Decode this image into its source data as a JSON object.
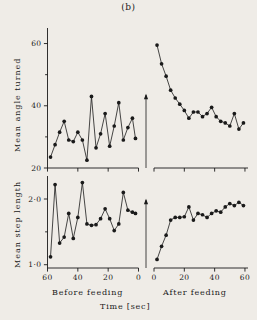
{
  "figure": {
    "title": "(b)",
    "xlabel": "Time [sec]",
    "left_section_label": "Before feeding",
    "right_section_label": "After feeding",
    "event_marker": "feeding-arrow",
    "background_color": "#efece7",
    "ink_color": "#1a1a1a"
  },
  "axes": {
    "angle_ylabel": "Mean angle turned",
    "step_ylabel": "Mean step length",
    "angle_yticks": [
      "60",
      "40",
      "20"
    ],
    "step_yticks": [
      "2·0",
      "1·0"
    ],
    "before_xticks": [
      "60",
      "40",
      "20",
      "0"
    ],
    "after_xticks": [
      "0",
      "20",
      "40",
      "60"
    ]
  },
  "chart_data": [
    {
      "type": "line",
      "id": "angle-before-feeding",
      "title": "(b)",
      "xlabel": "Time [sec]",
      "ylabel": "Mean angle turned",
      "panel": "top-left",
      "section": "Before feeding",
      "grid": false,
      "legend": null,
      "xlim": [
        60,
        0
      ],
      "ylim": [
        20,
        65
      ],
      "x": [
        58,
        55,
        52,
        49,
        46,
        43,
        40,
        37,
        34,
        31,
        28,
        25,
        22,
        19,
        16,
        13,
        10,
        7,
        4,
        2
      ],
      "y": [
        23.5,
        27.5,
        31.5,
        35.0,
        29.0,
        28.5,
        31.5,
        29.0,
        22.5,
        43.0,
        26.5,
        31.0,
        37.5,
        27.0,
        33.5,
        41.0,
        29.0,
        33.0,
        36.0,
        29.5
      ]
    },
    {
      "type": "line",
      "id": "angle-after-feeding",
      "title": "(b)",
      "xlabel": "Time [sec]",
      "ylabel": "Mean angle turned",
      "panel": "top-right",
      "section": "After feeding",
      "grid": false,
      "legend": null,
      "xlim": [
        0,
        62
      ],
      "ylim": [
        20,
        65
      ],
      "x": [
        2,
        5,
        8,
        11,
        14,
        17,
        20,
        23,
        26,
        29,
        32,
        35,
        38,
        41,
        44,
        47,
        50,
        53,
        56,
        59
      ],
      "y": [
        59.5,
        53.5,
        49.5,
        45.0,
        42.5,
        40.5,
        38.5,
        36.0,
        38.0,
        38.0,
        36.5,
        37.5,
        39.5,
        36.5,
        35.0,
        34.5,
        33.5,
        37.5,
        32.5,
        34.5
      ]
    },
    {
      "type": "line",
      "id": "step-before-feeding",
      "title": "(b)",
      "xlabel": "Time [sec]",
      "ylabel": "Mean step length",
      "panel": "bottom-left",
      "section": "Before feeding",
      "grid": false,
      "legend": null,
      "xlim": [
        60,
        0
      ],
      "ylim": [
        0.95,
        2.35
      ],
      "x": [
        58,
        55,
        52,
        49,
        46,
        43,
        40,
        37,
        34,
        31,
        28,
        25,
        22,
        19,
        16,
        13,
        10,
        7,
        4,
        2
      ],
      "y": [
        1.12,
        2.22,
        1.33,
        1.42,
        1.78,
        1.4,
        1.72,
        2.25,
        1.62,
        1.6,
        1.61,
        1.7,
        1.85,
        1.7,
        1.52,
        1.62,
        2.1,
        1.83,
        1.8,
        1.78
      ]
    },
    {
      "type": "line",
      "id": "step-after-feeding",
      "title": "(b)",
      "xlabel": "Time [sec]",
      "ylabel": "Mean step length",
      "panel": "bottom-right",
      "section": "After feeding",
      "grid": false,
      "legend": null,
      "xlim": [
        0,
        62
      ],
      "ylim": [
        0.95,
        2.35
      ],
      "x": [
        2,
        5,
        8,
        11,
        14,
        17,
        20,
        23,
        26,
        29,
        32,
        35,
        38,
        41,
        44,
        47,
        50,
        53,
        56,
        59
      ],
      "y": [
        1.08,
        1.28,
        1.45,
        1.68,
        1.72,
        1.72,
        1.73,
        1.88,
        1.68,
        1.78,
        1.76,
        1.72,
        1.78,
        1.82,
        1.8,
        1.88,
        1.93,
        1.9,
        1.95,
        1.9
      ]
    }
  ]
}
